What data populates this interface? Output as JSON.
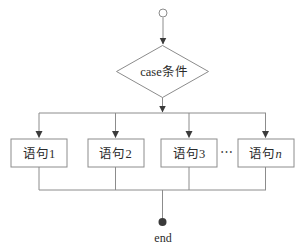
{
  "diagram": {
    "type": "flowchart-case-branch",
    "condition": {
      "label": "case条件"
    },
    "branches": [
      {
        "label": "语句1",
        "suffix": ""
      },
      {
        "label": "语句2",
        "suffix": ""
      },
      {
        "label": "语句3",
        "suffix": ""
      },
      {
        "label": "语句",
        "suffix": "n"
      }
    ],
    "ellipsis": "⋯",
    "end_label": "end",
    "colors": {
      "line": "#8c8c8c",
      "arrowhead": "#3a3a3a",
      "text": "#2b2b2b",
      "background": "#ffffff"
    }
  }
}
